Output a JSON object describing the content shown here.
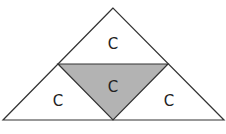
{
  "diagram": {
    "colors": {
      "stroke": "#333333",
      "shaded_fill": "#b3b3b3",
      "background": "#ffffff"
    },
    "regions": [
      {
        "id": "top",
        "label": "C",
        "shaded": false
      },
      {
        "id": "left",
        "label": "C",
        "shaded": false
      },
      {
        "id": "center",
        "label": "C",
        "shaded": true
      },
      {
        "id": "right",
        "label": "C",
        "shaded": false
      }
    ]
  }
}
